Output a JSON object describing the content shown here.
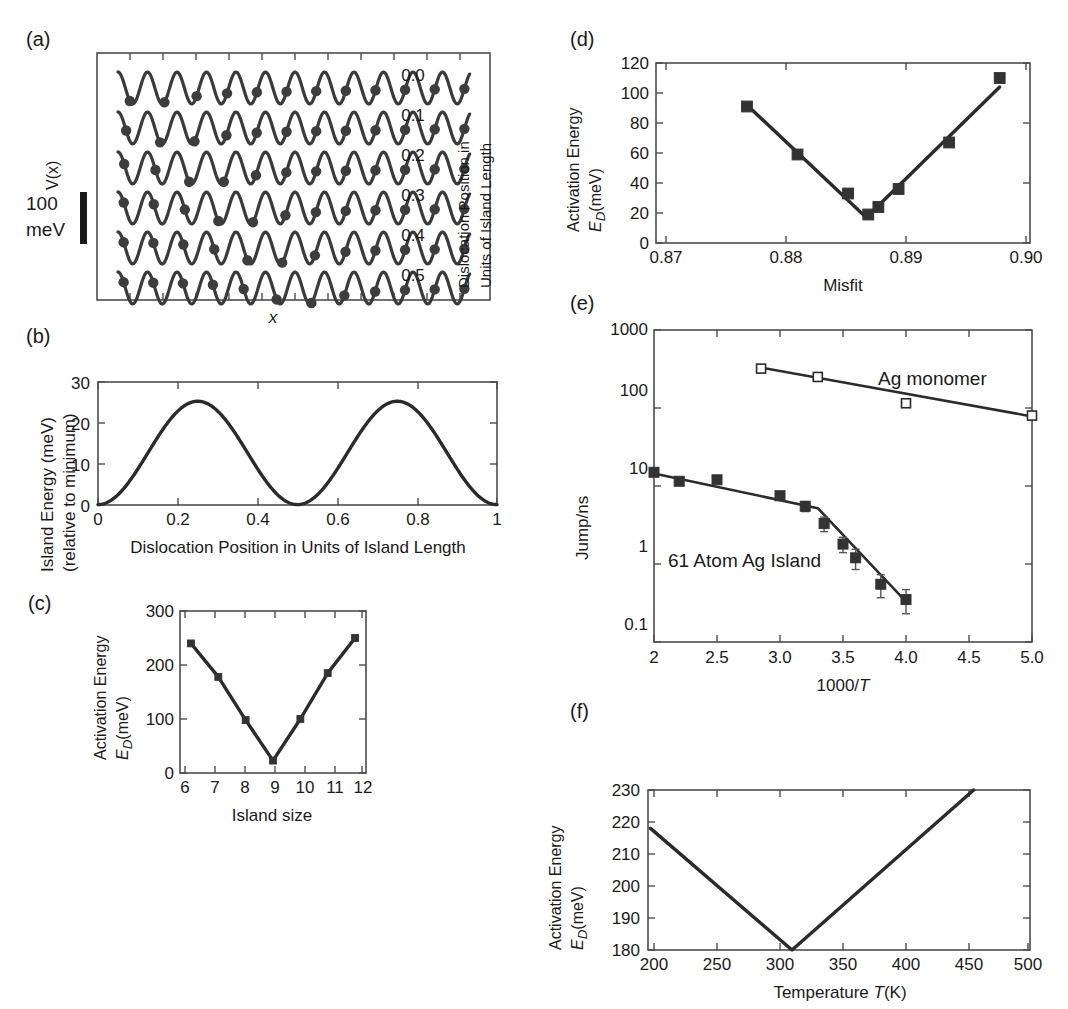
{
  "figure": {
    "panels": [
      "(a)",
      "(b)",
      "(c)",
      "(d)",
      "(e)",
      "(f)"
    ]
  },
  "panel_a": {
    "label": "(a)",
    "ylabel": "V(x)",
    "xlabel": "x",
    "right_axis_title_line1": "Dislocation Position in",
    "right_axis_title_line2": "Units of Island Length",
    "scalebar_value": "100",
    "scalebar_unit": "meV",
    "trace_labels": [
      "0.0",
      "0.1",
      "0.2",
      "0.3",
      "0.4",
      "0.5"
    ]
  },
  "panel_b": {
    "label": "(b)",
    "ylabel_line1": "Island Energy (meV)",
    "ylabel_line2": "(relative to minimum)",
    "xlabel": "Dislocation Position in Units of Island Length",
    "yticks": [
      "0",
      "10",
      "20",
      "30"
    ],
    "xticks": [
      "0",
      "0.2",
      "0.4",
      "0.6",
      "0.8",
      "1"
    ]
  },
  "panel_c": {
    "label": "(c)",
    "ylabel_line1": "Activation Energy",
    "ylabel_line2": "E_D(meV)",
    "xlabel": "Island size",
    "yticks": [
      "0",
      "100",
      "200",
      "300"
    ],
    "xticks": [
      "6",
      "7",
      "8",
      "9",
      "10",
      "11",
      "12"
    ]
  },
  "panel_d": {
    "label": "(d)",
    "ylabel_line1": "Activation Energy",
    "ylabel_line2": "E_D(meV)",
    "xlabel": "Misfit",
    "yticks": [
      "0",
      "20",
      "40",
      "60",
      "80",
      "100",
      "120"
    ],
    "xticks": [
      "0.87",
      "0.88",
      "0.89",
      "0.90"
    ]
  },
  "panel_e": {
    "label": "(e)",
    "ylabel": "Jump/ns",
    "xlabel": "1000/T",
    "yticks": [
      "0.1",
      "1",
      "10",
      "100",
      "1000"
    ],
    "xticks": [
      "2",
      "2.5",
      "3.0",
      "3.5",
      "4.0",
      "4.5",
      "5.0"
    ],
    "annotation_monomer": "Ag monomer",
    "annotation_island": "61 Atom Ag Island"
  },
  "panel_f": {
    "label": "(f)",
    "ylabel_line1": "Activation Energy",
    "ylabel_line2": "E_D(meV)",
    "xlabel": "Temperature T(K)",
    "yticks": [
      "180",
      "190",
      "200",
      "210",
      "220",
      "230"
    ],
    "xticks": [
      "200",
      "250",
      "300",
      "350",
      "400",
      "450",
      "500"
    ]
  },
  "colors": {
    "ink": "#1a1a1a",
    "curve": "#2b2b2b",
    "axis": "#4d4d4d",
    "marker_filled": "#333333",
    "marker_open_fill": "#ffffff"
  },
  "chart_data": [
    {
      "panel": "a",
      "type": "line",
      "title": "",
      "xlabel": "x",
      "ylabel": "V(x)",
      "legend_position": "right-inside",
      "grid": false,
      "description": "Six stacked sinusoidal substrate potential traces V(x) with atoms (filled dots) of a 1D island shown at their equilibrium positions; each trace corresponds to a different dislocation position in units of island length.",
      "scalebar": {
        "value": 100,
        "unit": "meV"
      },
      "traces": [
        {
          "name": "0.0",
          "dislocation_position": 0.0,
          "n_atoms": 12
        },
        {
          "name": "0.1",
          "dislocation_position": 0.1,
          "n_atoms": 12
        },
        {
          "name": "0.2",
          "dislocation_position": 0.2,
          "n_atoms": 12
        },
        {
          "name": "0.3",
          "dislocation_position": 0.3,
          "n_atoms": 12
        },
        {
          "name": "0.4",
          "dislocation_position": 0.4,
          "n_atoms": 12
        },
        {
          "name": "0.5",
          "dislocation_position": 0.5,
          "n_atoms": 12
        }
      ]
    },
    {
      "panel": "b",
      "type": "line",
      "title": "",
      "xlabel": "Dislocation Position in Units of Island Length",
      "ylabel": "Island Energy (meV) (relative to minimum)",
      "xlim": [
        0,
        1
      ],
      "ylim": [
        0,
        30
      ],
      "xticks": [
        0,
        0.2,
        0.4,
        0.6,
        0.8,
        1
      ],
      "yticks": [
        0,
        10,
        20,
        30
      ],
      "grid": false,
      "x": [
        0.0,
        0.05,
        0.1,
        0.15,
        0.2,
        0.25,
        0.3,
        0.35,
        0.4,
        0.45,
        0.5,
        0.55,
        0.6,
        0.65,
        0.7,
        0.75,
        0.8,
        0.85,
        0.9,
        0.95,
        1.0
      ],
      "values": [
        4.0,
        7.2,
        11.6,
        18.0,
        23.3,
        25.3,
        22.8,
        16.2,
        8.8,
        2.4,
        0.1,
        2.4,
        8.8,
        16.2,
        22.8,
        25.3,
        23.3,
        18.0,
        11.6,
        7.2,
        4.0
      ]
    },
    {
      "panel": "c",
      "type": "line",
      "title": "",
      "xlabel": "Island size",
      "ylabel": "Activation Energy E_D (meV)",
      "xlim": [
        5.6,
        12.4
      ],
      "ylim": [
        0,
        300
      ],
      "xticks": [
        6,
        7,
        8,
        9,
        10,
        11,
        12
      ],
      "yticks": [
        0,
        100,
        200,
        300
      ],
      "grid": false,
      "x": [
        6,
        7,
        8,
        9,
        10,
        11,
        12
      ],
      "values": [
        240,
        178,
        98,
        23,
        100,
        185,
        250
      ]
    },
    {
      "panel": "d",
      "type": "scatter",
      "title": "",
      "xlabel": "Misfit",
      "ylabel": "Activation Energy E_D (meV)",
      "xlim": [
        0.866,
        0.903
      ],
      "ylim": [
        0,
        120
      ],
      "xticks": [
        0.87,
        0.88,
        0.89,
        0.9
      ],
      "yticks": [
        0,
        20,
        40,
        60,
        80,
        100,
        120
      ],
      "grid": false,
      "x": [
        0.875,
        0.88,
        0.885,
        0.887,
        0.888,
        0.89,
        0.895,
        0.9
      ],
      "values": [
        91,
        59,
        33,
        19,
        24,
        36,
        67,
        110
      ],
      "fit_lines": [
        {
          "x": [
            0.875,
            0.8868
          ],
          "y": [
            92,
            17
          ]
        },
        {
          "x": [
            0.8868,
            0.9
          ],
          "y": [
            17,
            104
          ]
        }
      ]
    },
    {
      "panel": "e",
      "type": "scatter",
      "title": "",
      "xlabel": "1000/T",
      "ylabel": "Jump/ns",
      "yscale": "log",
      "xlim": [
        2,
        5
      ],
      "ylim": [
        0.1,
        1000
      ],
      "xticks": [
        2,
        2.5,
        3.0,
        3.5,
        4.0,
        4.5,
        5.0
      ],
      "yticks": [
        0.1,
        1,
        10,
        100,
        1000
      ],
      "grid": false,
      "series": [
        {
          "name": "Ag monomer",
          "marker": "open-square",
          "x": [
            2.85,
            3.3,
            4.0,
            5.0
          ],
          "values": [
            320,
            250,
            115,
            80
          ],
          "fit_line": {
            "x": [
              2.85,
              5.0
            ],
            "y": [
              330,
              78
            ]
          }
        },
        {
          "name": "61 Atom Ag Island",
          "marker": "filled-square",
          "x": [
            2.0,
            2.2,
            2.5,
            3.0,
            3.2,
            3.35,
            3.5,
            3.6,
            3.8,
            4.0
          ],
          "values": [
            15,
            11.5,
            12,
            7.5,
            5.5,
            3.3,
            1.8,
            1.2,
            0.55,
            0.35
          ],
          "errors": [
            0,
            0,
            0,
            0.9,
            0.8,
            0.7,
            0.4,
            0.35,
            0.18,
            0.12
          ],
          "fit_line": {
            "x": [
              2.0,
              3.3,
              4.0
            ],
            "y": [
              14.5,
              5.2,
              0.33
            ]
          }
        }
      ]
    },
    {
      "panel": "f",
      "type": "line",
      "title": "",
      "xlabel": "Temperature T(K)",
      "ylabel": "Activation Energy E_D (meV)",
      "xlim": [
        195,
        500
      ],
      "ylim": [
        180,
        230
      ],
      "xticks": [
        200,
        250,
        300,
        350,
        400,
        450,
        500
      ],
      "yticks": [
        180,
        190,
        200,
        210,
        220,
        230
      ],
      "grid": false,
      "x": [
        197,
        310,
        455
      ],
      "values": [
        218,
        180,
        230
      ]
    }
  ]
}
